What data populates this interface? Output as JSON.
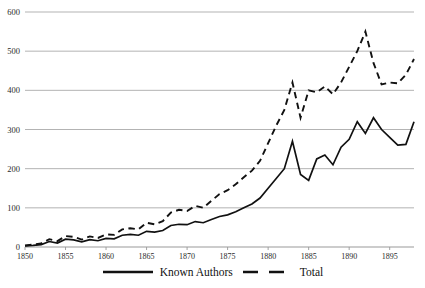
{
  "chart_data": {
    "type": "line",
    "title": "",
    "subtitle": "",
    "xlabel": "",
    "ylabel": "",
    "xlim": [
      1850,
      1898
    ],
    "ylim": [
      0,
      600
    ],
    "grid": true,
    "gridlines_y": [
      0,
      100,
      200,
      300,
      400,
      500,
      600
    ],
    "legend_position": "bottom",
    "y_ticks": [
      "0",
      "100",
      "200",
      "300",
      "400",
      "500",
      "600"
    ],
    "x_ticks": [
      "1850",
      "1855",
      "1860",
      "1865",
      "1870",
      "1875",
      "1880",
      "1885",
      "1890",
      "1895"
    ],
    "x": [
      1850,
      1851,
      1852,
      1853,
      1854,
      1855,
      1856,
      1857,
      1858,
      1859,
      1860,
      1861,
      1862,
      1863,
      1864,
      1865,
      1866,
      1867,
      1868,
      1869,
      1870,
      1871,
      1872,
      1873,
      1874,
      1875,
      1876,
      1877,
      1878,
      1879,
      1880,
      1881,
      1882,
      1883,
      1884,
      1885,
      1886,
      1887,
      1888,
      1889,
      1890,
      1891,
      1892,
      1893,
      1894,
      1895,
      1896,
      1897,
      1898
    ],
    "series": [
      {
        "name": "Known Authors",
        "style": "solid",
        "color": "#111111",
        "values": [
          3,
          4,
          6,
          14,
          10,
          20,
          18,
          13,
          19,
          16,
          22,
          21,
          30,
          32,
          30,
          40,
          38,
          42,
          55,
          58,
          57,
          65,
          62,
          70,
          78,
          82,
          90,
          100,
          110,
          125,
          150,
          175,
          200,
          270,
          185,
          170,
          225,
          235,
          210,
          255,
          275,
          320,
          290,
          330,
          300,
          280,
          260,
          262,
          320
        ]
      },
      {
        "name": "Total",
        "style": "dashed",
        "color": "#111111",
        "values": [
          4,
          6,
          9,
          20,
          15,
          28,
          26,
          19,
          27,
          23,
          32,
          31,
          45,
          48,
          45,
          62,
          58,
          66,
          88,
          95,
          92,
          105,
          100,
          118,
          135,
          145,
          160,
          178,
          195,
          220,
          265,
          310,
          350,
          420,
          330,
          400,
          395,
          410,
          390,
          420,
          460,
          500,
          550,
          470,
          415,
          420,
          418,
          440,
          480
        ]
      }
    ]
  },
  "legend": {
    "entries": [
      {
        "label": "Known Authors",
        "style": "solid"
      },
      {
        "label": "Total",
        "style": "dashed"
      }
    ]
  }
}
